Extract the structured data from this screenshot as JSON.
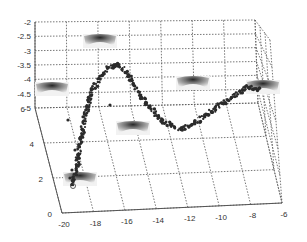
{
  "chart_data": {
    "type": "scatter3d",
    "title": "",
    "xlabel": "",
    "ylabel": "",
    "zlabel": "",
    "x_ticks": [
      "-20",
      "-18",
      "-16",
      "-14",
      "-12",
      "-10",
      "-8",
      "-6"
    ],
    "y_ticks": [
      "0",
      "2",
      "4",
      "6"
    ],
    "z_ticks": [
      "-2",
      "-2.5",
      "-3",
      "-3.5",
      "-4",
      "-4.5",
      "-5"
    ],
    "xlim": [
      -20,
      -6
    ],
    "ylim": [
      0,
      6
    ],
    "zlim": [
      -5,
      -2
    ],
    "grid": true,
    "legend": null,
    "series": [
      {
        "name": "trajectory",
        "marker": "dot",
        "description": "Dense point trajectory: rises steeply from bottom-left near x=-19, peaks around x=-17.5 at z≈-3.3, descends to a trough near x=-12 at z≈-5, then rises toward x=-7.5.",
        "approx_screen_path": [
          [
            73,
            185
          ],
          [
            78,
            160
          ],
          [
            84,
            120
          ],
          [
            92,
            90
          ],
          [
            108,
            68
          ],
          [
            118,
            64
          ],
          [
            128,
            75
          ],
          [
            140,
            95
          ],
          [
            160,
            120
          ],
          [
            180,
            130
          ],
          [
            200,
            120
          ],
          [
            220,
            105
          ],
          [
            248,
            87
          ],
          [
            262,
            90
          ]
        ]
      }
    ],
    "annotations": [
      {
        "type": "image-thumbnail",
        "label": "frame-1",
        "x": 100,
        "y": 40
      },
      {
        "type": "image-thumbnail",
        "label": "frame-2",
        "x": 52,
        "y": 88
      },
      {
        "type": "image-thumbnail",
        "label": "frame-3",
        "x": 193,
        "y": 82
      },
      {
        "type": "image-thumbnail",
        "label": "frame-4",
        "x": 263,
        "y": 86
      },
      {
        "type": "image-thumbnail",
        "label": "frame-5",
        "x": 133,
        "y": 127
      },
      {
        "type": "image-thumbnail",
        "label": "frame-6",
        "x": 80,
        "y": 178
      }
    ]
  }
}
